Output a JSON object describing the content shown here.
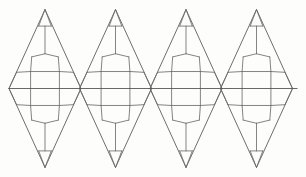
{
  "figure": {
    "background_color": "#fdfdfc",
    "line_color": "#6e6e6e",
    "outline_color": "#5d5d5d",
    "axis_color": "#585858",
    "stroke_width": 0.85
  },
  "canvas": {
    "width": 306,
    "height": 177
  },
  "geometry": {
    "unit_count": 4,
    "unit_width": 70.5,
    "first_center_x": 45.0,
    "center_y": 88.5,
    "half_height": 79.0,
    "half_width": 36.0,
    "axis": {
      "label": "horizontal-midline",
      "y": 88.5,
      "x_start": 8.5,
      "x_end": 297.5
    },
    "shared_vertices_x": [
      9.0,
      80.0,
      151.0,
      222.0,
      293.0
    ],
    "apex_x": [
      45.0,
      116.0,
      187.0,
      258.0
    ],
    "apex_y_top": 10.0,
    "apex_y_bottom": 167.0
  },
  "cell_template": {
    "comment": "Normalized coordinates for one rhombus unit. Origin at unit center; x in [-1,1] across half-width, y in [-1,1] across half-height. Upper half listed; lower half is the mirror image through y=0.",
    "nodes": {
      "apex": [
        0.0,
        -1.0
      ],
      "cap_left": [
        -0.175,
        -0.79
      ],
      "cap_right": [
        0.175,
        -0.79
      ],
      "stem_top": [
        0.0,
        -0.79
      ],
      "stem_bottom": [
        0.0,
        -0.44
      ],
      "shoulder_left": [
        -0.37,
        -0.4
      ],
      "shoulder_right": [
        0.37,
        -0.4
      ],
      "hex_upper_left": [
        -0.4,
        -0.215
      ],
      "hex_upper_right": [
        0.4,
        -0.215
      ],
      "wing_left_outer": [
        -0.79,
        -0.205
      ],
      "wing_right_outer": [
        0.79,
        -0.205
      ],
      "hex_mid_left": [
        -0.4,
        0.0
      ],
      "hex_mid_right": [
        0.4,
        0.0
      ],
      "axis_left": [
        -1.0,
        0.0
      ],
      "axis_right": [
        1.0,
        0.0
      ]
    },
    "edges": [
      [
        "apex",
        "cap_left"
      ],
      [
        "apex",
        "cap_right"
      ],
      [
        "cap_left",
        "cap_right"
      ],
      [
        "stem_top",
        "stem_bottom"
      ],
      [
        "stem_bottom",
        "shoulder_left"
      ],
      [
        "stem_bottom",
        "shoulder_right"
      ],
      [
        "shoulder_left",
        "hex_upper_left"
      ],
      [
        "shoulder_right",
        "hex_upper_right"
      ],
      [
        "hex_upper_left",
        "hex_upper_right"
      ],
      [
        "hex_upper_left",
        "hex_mid_left"
      ],
      [
        "hex_upper_right",
        "hex_mid_right"
      ],
      [
        "hex_upper_left",
        "wing_left_outer"
      ],
      [
        "hex_upper_right",
        "wing_right_outer"
      ],
      [
        "wing_left_outer",
        "axis_left"
      ],
      [
        "wing_right_outer",
        "axis_right"
      ]
    ]
  },
  "legend": {
    "visible": false,
    "entries": []
  },
  "annotations": []
}
